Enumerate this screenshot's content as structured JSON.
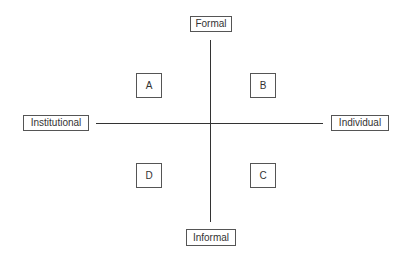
{
  "diagram": {
    "type": "quadrant",
    "axes": {
      "vertical": {
        "top_label": "Formal",
        "bottom_label": "Informal"
      },
      "horizontal": {
        "left_label": "Institutional",
        "right_label": "Individual"
      }
    },
    "quadrants": [
      {
        "label": "A",
        "position": "top-left"
      },
      {
        "label": "B",
        "position": "top-right"
      },
      {
        "label": "C",
        "position": "bottom-right"
      },
      {
        "label": "D",
        "position": "bottom-left"
      }
    ],
    "colors": {
      "line": "#333333",
      "border": "#555555",
      "text": "#333333",
      "background": "#ffffff"
    }
  }
}
